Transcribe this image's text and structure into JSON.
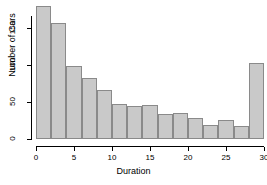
{
  "chart_data": {
    "type": "bar",
    "title": "",
    "subtitle": "",
    "xlabel": "Duration",
    "ylabel": "Number of Cars",
    "xlim": [
      0,
      30
    ],
    "ylim": [
      0,
      185
    ],
    "bin_width": 2,
    "grid": false,
    "legend": null,
    "xticks": [
      0,
      5,
      10,
      15,
      20,
      25,
      30
    ],
    "yticks": [
      0,
      50,
      100,
      150
    ],
    "bin_edges": [
      0,
      2,
      4,
      6,
      8,
      10,
      12,
      14,
      16,
      18,
      20,
      22,
      24,
      26,
      28,
      30
    ],
    "categories": [
      "0-2",
      "2-4",
      "4-6",
      "6-8",
      "8-10",
      "10-12",
      "12-14",
      "14-16",
      "16-18",
      "18-20",
      "20-22",
      "22-24",
      "24-26",
      "26-28",
      "28-30"
    ],
    "values": [
      180,
      156,
      99,
      83,
      66,
      47,
      45,
      46,
      34,
      35,
      28,
      19,
      26,
      18,
      103
    ],
    "bar_fill": "#c9c9c9",
    "bar_border": "#8a8a8a"
  },
  "axes": {
    "x_label": "Duration",
    "y_label": "Number of Cars",
    "x_tick_labels": [
      "0",
      "5",
      "10",
      "15",
      "20",
      "25",
      "30"
    ],
    "y_tick_labels": [
      "0",
      "50",
      "100",
      "150"
    ]
  }
}
